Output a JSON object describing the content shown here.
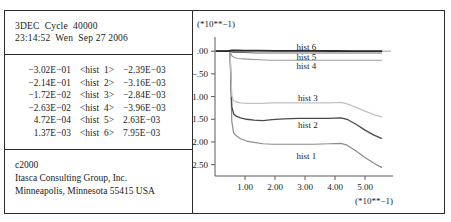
{
  "window": {
    "background_color": "#ffffff",
    "border_color": "#2b2b2b"
  },
  "info_panel": {
    "header": {
      "line1": "3DEC  Cycle  40000",
      "line2": "23:14:52  Wen  Sep 27 2006"
    },
    "hist_table": {
      "rows": [
        {
          "min": "−3.02E−01",
          "name": "<hist  1>",
          "max": "−2.39E−03"
        },
        {
          "min": "−2.14E−01",
          "name": "<hist  2>",
          "max": "−3.16E−03"
        },
        {
          "min": "−1.72E−02",
          "name": "<hist  3>",
          "max": "−2.84E−03"
        },
        {
          "min": "−2.63E−02",
          "name": "<hist  4>",
          "max": "−3.96E−03"
        },
        {
          "min": "4.72E−04",
          "name": "<hist  5>",
          "max": "2.63E−03"
        },
        {
          "min": "1.37E−03",
          "name": "<hist  6>",
          "max": "7.95E−03"
        }
      ]
    },
    "footer": {
      "line1": "c2000",
      "line2": "Itasca Consulting Group, Inc.",
      "line3": "Minneapolis, Minnesota 55415 USA"
    }
  },
  "chart_data": {
    "type": "line",
    "title": "",
    "xlabel": "(*10**−1)",
    "ylabel": "(*10**−1)",
    "y_exponent_label": "(*10**−1)",
    "x_exponent_label": "(*10**−1)",
    "grid": false,
    "legend": "inline-labels",
    "xlim": [
      0.0,
      5.8
    ],
    "ylim": [
      -2.75,
      0.18
    ],
    "xticks": [
      1.0,
      2.0,
      3.0,
      4.0,
      5.0
    ],
    "xtick_labels": [
      "1.00",
      "2.00",
      "3.00",
      "4.00",
      "5.00"
    ],
    "yticks": [
      0.0,
      -0.5,
      -1.0,
      -1.5,
      -2.0,
      -2.5
    ],
    "ytick_labels": [
      ".00",
      "−.50",
      "−1.00",
      "−1.50",
      "−2.00",
      "−2.50"
    ],
    "series": [
      {
        "name": "hist 1",
        "color": "#8c8c8c",
        "width": 1.2,
        "label_x": 3.05,
        "label_y": -2.32,
        "x": [
          0.05,
          0.5,
          0.56,
          0.62,
          0.7,
          0.85,
          1.05,
          1.3,
          1.6,
          1.9,
          2.3,
          2.8,
          3.3,
          3.8,
          4.2,
          4.4,
          4.7,
          5.0,
          5.3,
          5.55
        ],
        "y": [
          0.0,
          0.0,
          -1.55,
          -1.8,
          -1.86,
          -1.93,
          -1.98,
          -2.01,
          -2.04,
          -2.05,
          -2.05,
          -2.05,
          -2.05,
          -2.04,
          -2.03,
          -2.07,
          -2.2,
          -2.34,
          -2.47,
          -2.56
        ]
      },
      {
        "name": "hist 2",
        "color": "#4a4a4a",
        "width": 1.3,
        "label_x": 3.1,
        "label_y": -1.62,
        "x": [
          0.05,
          0.5,
          0.56,
          0.62,
          0.7,
          0.85,
          1.05,
          1.3,
          1.6,
          1.9,
          2.3,
          2.8,
          3.3,
          3.8,
          4.2,
          4.4,
          4.7,
          5.0,
          5.3,
          5.55
        ],
        "y": [
          0.0,
          0.0,
          -1.22,
          -1.38,
          -1.43,
          -1.47,
          -1.5,
          -1.52,
          -1.53,
          -1.51,
          -1.49,
          -1.48,
          -1.48,
          -1.48,
          -1.47,
          -1.5,
          -1.61,
          -1.74,
          -1.85,
          -1.92
        ]
      },
      {
        "name": "hist 3",
        "color": "#c2c2c2",
        "width": 1.3,
        "label_x": 3.1,
        "label_y": -1.04,
        "x": [
          0.05,
          0.5,
          0.56,
          0.62,
          0.7,
          0.85,
          1.05,
          1.3,
          1.6,
          1.9,
          2.3,
          2.8,
          3.3,
          3.8,
          4.2,
          4.4,
          4.7,
          5.0,
          5.3,
          5.55
        ],
        "y": [
          0.0,
          0.0,
          -0.98,
          -1.09,
          -1.12,
          -1.14,
          -1.15,
          -1.15,
          -1.15,
          -1.14,
          -1.14,
          -1.14,
          -1.14,
          -1.14,
          -1.13,
          -1.16,
          -1.24,
          -1.32,
          -1.4,
          -1.45
        ]
      },
      {
        "name": "hist 4",
        "color": "#9a9a9a",
        "width": 1.1,
        "label_x": 3.05,
        "label_y": -0.33,
        "x": [
          0.05,
          0.5,
          0.56,
          0.64,
          0.75,
          0.95,
          1.2,
          1.5,
          1.85,
          2.2,
          2.7,
          3.2,
          3.8,
          4.4,
          5.0,
          5.55
        ],
        "y": [
          0.0,
          0.0,
          -0.1,
          -0.14,
          -0.16,
          -0.17,
          -0.18,
          -0.19,
          -0.2,
          -0.2,
          -0.2,
          -0.2,
          -0.2,
          -0.2,
          -0.2,
          -0.2
        ]
      },
      {
        "name": "hist 5",
        "color": "#6e6e6e",
        "width": 1.1,
        "label_x": 3.05,
        "label_y": -0.13,
        "x": [
          0.05,
          0.5,
          0.55,
          0.62,
          0.75,
          1.0,
          1.4,
          1.9,
          2.5,
          3.2,
          4.0,
          4.8,
          5.55
        ],
        "y": [
          0.0,
          0.0,
          -0.02,
          -0.03,
          -0.03,
          -0.03,
          -0.04,
          -0.04,
          -0.04,
          -0.04,
          -0.04,
          -0.04,
          -0.04
        ]
      },
      {
        "name": "hist 6",
        "color": "#2b2b2b",
        "width": 1.8,
        "label_x": 3.05,
        "label_y": 0.1,
        "x": [
          0.05,
          0.45,
          0.55,
          0.7,
          1.0,
          1.5,
          2.0,
          2.6,
          3.2,
          3.9,
          4.6,
          5.2,
          5.55
        ],
        "y": [
          0.0,
          0.0,
          0.015,
          0.015,
          0.012,
          0.01,
          0.008,
          0.006,
          0.005,
          0.004,
          0.003,
          0.002,
          0.001
        ]
      }
    ]
  }
}
